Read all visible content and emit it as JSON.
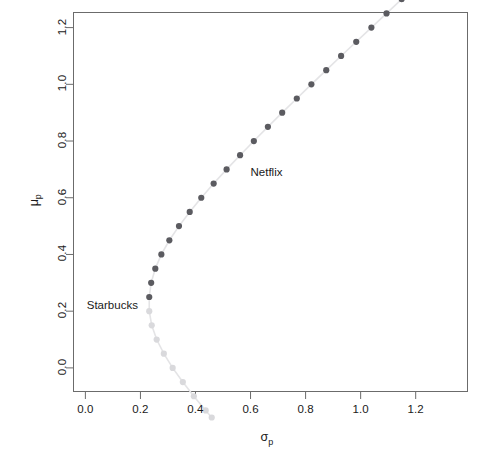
{
  "chart_data": {
    "type": "scatter",
    "title": "",
    "subtitle": "",
    "xlabel": "sigma_p",
    "xlabel_display": "σ",
    "xlabel_sub": "p",
    "ylabel": "mu_p",
    "ylabel_display": "μ",
    "ylabel_sub": "p",
    "xlim": [
      -0.045,
      1.39
    ],
    "ylim": [
      -0.085,
      1.255
    ],
    "xticks": [
      0.0,
      0.2,
      0.4,
      0.6,
      0.8,
      1.0,
      1.2
    ],
    "xtick_labels": [
      "0.0",
      "0.2",
      "0.4",
      "0.6",
      "0.8",
      "1.0",
      "1.2"
    ],
    "yticks": [
      0.0,
      0.2,
      0.4,
      0.6,
      0.8,
      1.0,
      1.2
    ],
    "ytick_labels": [
      "0.0",
      "0.2",
      "0.4",
      "0.6",
      "0.8",
      "1.0",
      "1.2"
    ],
    "grid": false,
    "legend": "none",
    "frame": true,
    "colors": {
      "efficient": "#5b5b60",
      "inefficient": "#d9d9dc",
      "connector_line": "#e4e4e6",
      "axis": "#6b6b6b",
      "text": "#1a1a1a"
    },
    "series": [
      {
        "name": "efficient frontier",
        "color": "#5b5b60",
        "marker": "filled-circle",
        "marker_size": 5,
        "points": [
          {
            "x": 0.232,
            "y": 0.25
          },
          {
            "x": 0.239,
            "y": 0.3
          },
          {
            "x": 0.254,
            "y": 0.35
          },
          {
            "x": 0.276,
            "y": 0.4
          },
          {
            "x": 0.305,
            "y": 0.45
          },
          {
            "x": 0.34,
            "y": 0.5
          },
          {
            "x": 0.379,
            "y": 0.55
          },
          {
            "x": 0.421,
            "y": 0.6
          },
          {
            "x": 0.466,
            "y": 0.65
          },
          {
            "x": 0.513,
            "y": 0.7
          },
          {
            "x": 0.562,
            "y": 0.75
          },
          {
            "x": 0.612,
            "y": 0.8
          },
          {
            "x": 0.663,
            "y": 0.85
          },
          {
            "x": 0.715,
            "y": 0.9
          },
          {
            "x": 0.768,
            "y": 0.95
          },
          {
            "x": 0.821,
            "y": 1.0
          },
          {
            "x": 0.875,
            "y": 1.05
          },
          {
            "x": 0.929,
            "y": 1.1
          },
          {
            "x": 0.984,
            "y": 1.15
          },
          {
            "x": 1.039,
            "y": 1.2
          },
          {
            "x": 1.094,
            "y": 1.25
          },
          {
            "x": 1.149,
            "y": 1.3
          },
          {
            "x": 1.205,
            "y": 1.35
          },
          {
            "x": 1.261,
            "y": 1.4
          },
          {
            "x": 1.317,
            "y": 1.45
          }
        ]
      },
      {
        "name": "inefficient frontier",
        "color": "#d9d9dc",
        "marker": "filled-circle",
        "marker_size": 5,
        "points": [
          {
            "x": 0.232,
            "y": 0.2
          },
          {
            "x": 0.241,
            "y": 0.15
          },
          {
            "x": 0.259,
            "y": 0.1
          },
          {
            "x": 0.285,
            "y": 0.05
          },
          {
            "x": 0.317,
            "y": 0.0
          },
          {
            "x": 0.354,
            "y": -0.05
          },
          {
            "x": 0.394,
            "y": -0.1
          },
          {
            "x": 0.437,
            "y": -0.15
          },
          {
            "x": 0.459,
            "y": -0.175
          }
        ]
      }
    ],
    "annotations": [
      {
        "name": "netflix-label",
        "text": "Netflix",
        "x": 0.6,
        "y": 0.685
      },
      {
        "name": "starbucks-label",
        "text": "Starbucks",
        "x": 0.005,
        "y": 0.215
      }
    ]
  },
  "labels": {
    "netflix": "Netflix",
    "starbucks": "Starbucks",
    "x_axis_symbol": "σ",
    "x_axis_sub": "p",
    "y_axis_symbol": "μ",
    "y_axis_sub": "p"
  }
}
